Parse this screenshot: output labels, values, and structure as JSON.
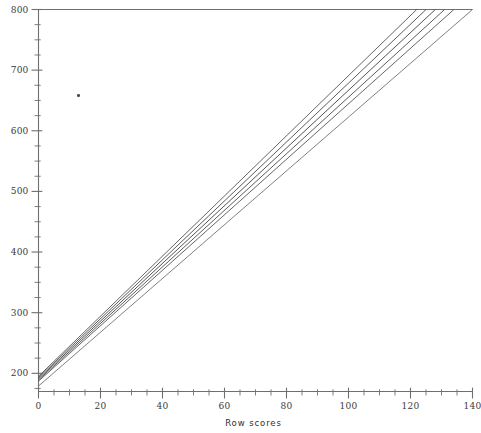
{
  "chart_data": {
    "type": "line",
    "title": "",
    "subtitle": "",
    "xlabel": "Row scores",
    "ylabel": "",
    "xlim": [
      0,
      140
    ],
    "ylim": [
      170,
      800
    ],
    "grid": false,
    "legend_position": "none",
    "x_ticks_major": [
      0,
      20,
      40,
      60,
      80,
      100,
      120,
      140
    ],
    "x_tick_labels": [
      "0",
      "20",
      "40",
      "60",
      "80",
      "100",
      "120",
      "140"
    ],
    "x_minor_tick_step": 5,
    "y_ticks_major": [
      200,
      300,
      400,
      500,
      600,
      700,
      800
    ],
    "y_tick_labels": [
      "200",
      "300",
      "400",
      "500",
      "600",
      "700",
      "800"
    ],
    "y_minor_tick_step": 25,
    "series": [
      {
        "name": "form-1",
        "points": [
          [
            0,
            195
          ],
          [
            122,
            800
          ]
        ],
        "color": "#555555",
        "width": 0.9
      },
      {
        "name": "form-2",
        "points": [
          [
            0,
            193
          ],
          [
            125,
            800
          ]
        ],
        "color": "#4a4a4a",
        "width": 0.9
      },
      {
        "name": "form-3",
        "points": [
          [
            0,
            191
          ],
          [
            128,
            800
          ]
        ],
        "color": "#3f3f3f",
        "width": 0.9
      },
      {
        "name": "form-4",
        "points": [
          [
            0,
            189
          ],
          [
            131,
            800
          ]
        ],
        "color": "#4a4a4a",
        "width": 0.9
      },
      {
        "name": "form-5",
        "points": [
          [
            0,
            187
          ],
          [
            134,
            800
          ]
        ],
        "color": "#555555",
        "width": 0.9
      },
      {
        "name": "form-6",
        "points": [
          [
            0,
            179
          ],
          [
            140,
            800
          ]
        ],
        "color": "#6a6a6a",
        "width": 0.85
      }
    ],
    "annotations": [
      {
        "name": "scan-speck",
        "x": 13,
        "y": 658
      }
    ]
  },
  "axis": {
    "frame_color": "#6f6f6f",
    "text_color": "#3a3a3a"
  }
}
